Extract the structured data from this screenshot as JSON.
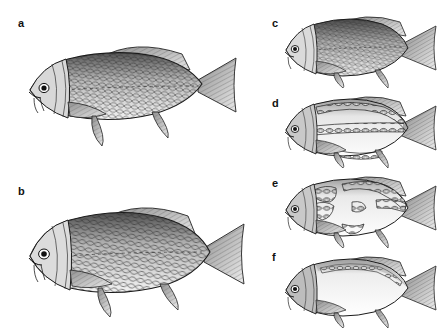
{
  "figure": {
    "background_color": "#ffffff",
    "ink_color": "#1a1a1a",
    "style": "pen-and-ink stipple engraving, grayscale",
    "columns": 2,
    "panel_count": 6
  },
  "panels": [
    {
      "label": "a",
      "column": "left",
      "subject": "common carp, fully scaled form",
      "scale_pattern": "complete uniform scale cover",
      "body_depth": "moderate, elongate",
      "barbels": 2,
      "dorsal_fin": "long-based, serrated ray",
      "caudal_fin": "forked",
      "label_x": 18,
      "label_y": 18,
      "art_x": 22,
      "art_y": 28,
      "art_w": 226,
      "art_h": 118
    },
    {
      "label": "b",
      "column": "left",
      "subject": "common carp, fully scaled deep-bodied form",
      "scale_pattern": "complete uniform scale cover",
      "body_depth": "deep, high-backed",
      "barbels": 2,
      "dorsal_fin": "long-based, serrated ray",
      "caudal_fin": "forked",
      "label_x": 18,
      "label_y": 186,
      "art_x": 22,
      "art_y": 192,
      "art_w": 232,
      "art_h": 125
    },
    {
      "label": "c",
      "column": "right",
      "subject": "carp, scaled form",
      "scale_pattern": "complete uniform scale cover",
      "body_depth": "moderate",
      "barbels": 2,
      "dorsal_fin": "long-based",
      "caudal_fin": "forked",
      "label_x": 272,
      "label_y": 18,
      "art_x": 280,
      "art_y": 10,
      "art_w": 160,
      "art_h": 78
    },
    {
      "label": "d",
      "column": "right",
      "subject": "mirror carp, line (row-scaled) form",
      "scale_pattern": "rows of enlarged scales along dorsal ridge and lateral line, bare skin between",
      "body_depth": "moderate",
      "barbels": 2,
      "dorsal_fin": "long-based",
      "caudal_fin": "forked",
      "label_x": 272,
      "label_y": 98,
      "art_x": 280,
      "art_y": 90,
      "art_w": 160,
      "art_h": 78
    },
    {
      "label": "e",
      "column": "right",
      "subject": "mirror carp, scattered-scale form",
      "scale_pattern": "irregular scattered clusters of enlarged scales",
      "body_depth": "moderate",
      "barbels": 2,
      "dorsal_fin": "long-based",
      "caudal_fin": "forked",
      "label_x": 272,
      "label_y": 178,
      "art_x": 280,
      "art_y": 170,
      "art_w": 160,
      "art_h": 78
    },
    {
      "label": "f",
      "column": "right",
      "subject": "leather (nude) carp",
      "scale_pattern": "essentially scaleless; a few scales along dorsal base only",
      "body_depth": "moderate",
      "barbels": 2,
      "dorsal_fin": "long-based",
      "caudal_fin": "forked",
      "label_x": 272,
      "label_y": 252,
      "art_x": 280,
      "art_y": 248,
      "art_w": 160,
      "art_h": 80
    }
  ]
}
